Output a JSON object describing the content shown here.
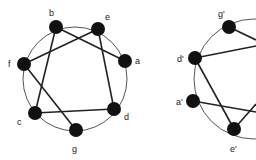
{
  "graphs": [
    {
      "circle": {
        "cx": 75,
        "cy": 79,
        "r": 52
      },
      "nodes": [
        {
          "id": "a",
          "label": "a",
          "x": 125,
          "y": 61,
          "lx": 135,
          "ly": 64
        },
        {
          "id": "b",
          "label": "b",
          "x": 56,
          "y": 27,
          "lx": 49,
          "ly": 16
        },
        {
          "id": "e",
          "label": "e",
          "x": 98,
          "y": 29,
          "lx": 105,
          "ly": 20
        },
        {
          "id": "f",
          "label": "f",
          "x": 24,
          "y": 64,
          "lx": 8,
          "ly": 67
        },
        {
          "id": "c",
          "label": "c",
          "x": 35,
          "y": 113,
          "lx": 17,
          "ly": 125
        },
        {
          "id": "d",
          "label": "d",
          "x": 114,
          "y": 109,
          "lx": 124,
          "ly": 120
        },
        {
          "id": "g",
          "label": "g",
          "x": 76,
          "y": 130,
          "lx": 72,
          "ly": 152
        }
      ],
      "edges": [
        [
          "b",
          "a"
        ],
        [
          "b",
          "c"
        ],
        [
          "e",
          "f"
        ],
        [
          "e",
          "d"
        ],
        [
          "f",
          "g"
        ],
        [
          "c",
          "d"
        ]
      ]
    },
    {
      "circle": {
        "cx": 254,
        "cy": 79,
        "r": 60
      },
      "nodes": [
        {
          "id": "g'",
          "label": "g'",
          "x": 229,
          "y": 27,
          "lx": 218,
          "ly": 17
        },
        {
          "id": "d'",
          "label": "d'",
          "x": 195,
          "y": 58,
          "lx": 177,
          "ly": 62
        },
        {
          "id": "a'",
          "label": "a'",
          "x": 193,
          "y": 101,
          "lx": 176,
          "ly": 105
        },
        {
          "id": "e'",
          "label": "e'",
          "x": 234,
          "y": 129,
          "lx": 230,
          "ly": 152
        }
      ],
      "edges": [
        [
          "d'",
          "e'"
        ]
      ],
      "offscreen_edges": [
        {
          "from": "g'",
          "to": [
            256,
            40
          ]
        },
        {
          "from": "d'",
          "to": [
            256,
            46
          ]
        },
        {
          "from": "a'",
          "to": [
            256,
            112
          ]
        },
        {
          "from": "e'",
          "to": [
            256,
            104
          ]
        }
      ]
    }
  ],
  "style": {
    "node_color": "#111111",
    "edge_color": "#222222",
    "circle_color": "#555555",
    "node_radius": 7
  }
}
